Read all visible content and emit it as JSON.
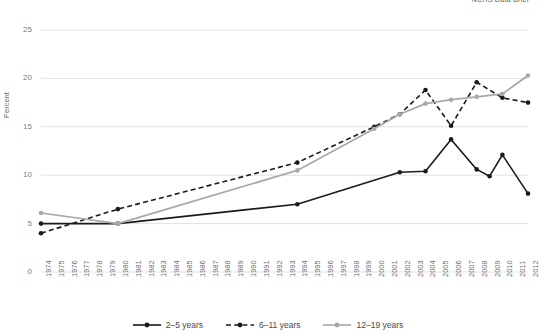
{
  "header": {
    "clipped_title": "NCHS Data Brief"
  },
  "axes": {
    "ylabel": "Percent",
    "yticks": [
      "0",
      "5",
      "10",
      "15",
      "20",
      "25"
    ],
    "ymin": 0,
    "ymax": 25
  },
  "legend": [
    {
      "label": "2–5 years",
      "color": "#1a1a1a",
      "style": "solid",
      "marker": "circle"
    },
    {
      "label": "6–11 years",
      "color": "#1a1a1a",
      "style": "dashed",
      "marker": "circle"
    },
    {
      "label": "12–19 years",
      "color": "#a9a9a9",
      "style": "solid",
      "marker": "circle"
    }
  ],
  "chart_data": {
    "type": "line",
    "title": "",
    "xlabel": "",
    "ylabel": "Percent",
    "ylim": [
      0,
      25
    ],
    "grid": true,
    "legend_position": "bottom",
    "categories": [
      "1974",
      "1975",
      "1976",
      "1977",
      "1978",
      "1979",
      "1980",
      "1981",
      "1982",
      "1983",
      "1984",
      "1985",
      "1986",
      "1987",
      "1988",
      "1989",
      "1990",
      "1991",
      "1992",
      "1993",
      "1994",
      "1995",
      "1996",
      "1997",
      "1998",
      "1999",
      "2000",
      "2001",
      "2002",
      "2003",
      "2004",
      "2005",
      "2006",
      "2007",
      "2008",
      "2009",
      "2010",
      "2011",
      "2012"
    ],
    "series": [
      {
        "name": "2–5 years",
        "color": "#1a1a1a",
        "style": "solid",
        "points": [
          {
            "x": "1974",
            "y": 5.0
          },
          {
            "x": "1980",
            "y": 5.0
          },
          {
            "x": "1994",
            "y": 7.0
          },
          {
            "x": "2002",
            "y": 10.3
          },
          {
            "x": "2004",
            "y": 10.4
          },
          {
            "x": "2006",
            "y": 13.7
          },
          {
            "x": "2008",
            "y": 10.6
          },
          {
            "x": "2009",
            "y": 9.9
          },
          {
            "x": "2010",
            "y": 12.1
          },
          {
            "x": "2012",
            "y": 8.1
          }
        ]
      },
      {
        "name": "6–11 years",
        "color": "#1a1a1a",
        "style": "dashed",
        "points": [
          {
            "x": "1974",
            "y": 4.0
          },
          {
            "x": "1980",
            "y": 6.5
          },
          {
            "x": "1994",
            "y": 11.3
          },
          {
            "x": "2000",
            "y": 15.0
          },
          {
            "x": "2002",
            "y": 16.3
          },
          {
            "x": "2004",
            "y": 18.8
          },
          {
            "x": "2006",
            "y": 15.1
          },
          {
            "x": "2008",
            "y": 19.6
          },
          {
            "x": "2010",
            "y": 18.0
          },
          {
            "x": "2012",
            "y": 17.5
          }
        ]
      },
      {
        "name": "12–19 years",
        "color": "#a9a9a9",
        "style": "solid",
        "points": [
          {
            "x": "1974",
            "y": 6.1
          },
          {
            "x": "1980",
            "y": 5.0
          },
          {
            "x": "1994",
            "y": 10.5
          },
          {
            "x": "2000",
            "y": 14.8
          },
          {
            "x": "2002",
            "y": 16.3
          },
          {
            "x": "2004",
            "y": 17.4
          },
          {
            "x": "2006",
            "y": 17.8
          },
          {
            "x": "2008",
            "y": 18.1
          },
          {
            "x": "2010",
            "y": 18.4
          },
          {
            "x": "2012",
            "y": 20.3
          }
        ]
      }
    ]
  }
}
